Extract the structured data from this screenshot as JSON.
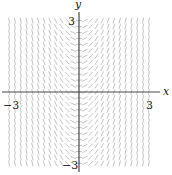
{
  "chart_data": {
    "type": "slope_field",
    "title": "",
    "equation": "dy/dx = 2x",
    "xlabel": "x",
    "ylabel": "y",
    "xlim": [
      -3,
      3
    ],
    "ylim": [
      -3,
      3
    ],
    "x_ticks": [
      {
        "value": -3,
        "label": "−3"
      },
      {
        "value": 3,
        "label": "3"
      }
    ],
    "y_ticks": [
      {
        "value": 3,
        "label": "3"
      },
      {
        "value": -3,
        "label": "−3"
      }
    ],
    "grid_step": 0.25,
    "segment_color": "#bdbdbd",
    "axis_color": "#4a4a4a",
    "grid": false,
    "legend": null
  },
  "labels": {
    "x_axis": "x",
    "y_axis": "y",
    "x_min": "−3",
    "x_max": "3",
    "y_max": "3",
    "y_min": "−3"
  }
}
